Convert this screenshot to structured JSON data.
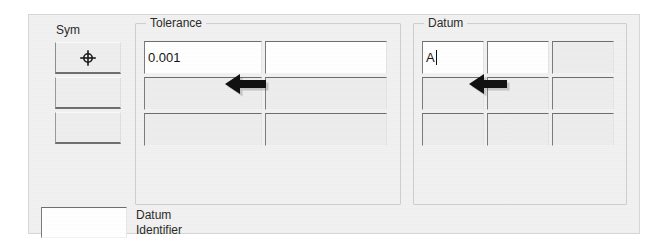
{
  "panel": {
    "sym": {
      "label": "Sym",
      "cells": [
        {
          "symbol": "position-symbol",
          "value": ""
        },
        {
          "symbol": "",
          "value": ""
        },
        {
          "symbol": "",
          "value": ""
        }
      ]
    },
    "tolerance": {
      "label": "Tolerance",
      "rows": [
        [
          {
            "value": "0.001",
            "enabled": true
          },
          {
            "value": "",
            "enabled": true
          }
        ],
        [
          {
            "value": "",
            "enabled": false
          },
          {
            "value": "",
            "enabled": false
          }
        ],
        [
          {
            "value": "",
            "enabled": false
          },
          {
            "value": "",
            "enabled": false
          }
        ]
      ]
    },
    "datum": {
      "label": "Datum",
      "rows": [
        [
          {
            "value": "A",
            "enabled": true,
            "caret": true
          },
          {
            "value": "",
            "enabled": true
          },
          {
            "value": "",
            "enabled": false
          }
        ],
        [
          {
            "value": "",
            "enabled": false
          },
          {
            "value": "",
            "enabled": false
          },
          {
            "value": "",
            "enabled": false
          }
        ],
        [
          {
            "value": "",
            "enabled": false
          },
          {
            "value": "",
            "enabled": false
          },
          {
            "value": "",
            "enabled": false
          }
        ]
      ]
    },
    "datum_identifier": {
      "label": "Datum\nIdentifier",
      "value": ""
    },
    "annotations": [
      {
        "name": "arrow-tolerance",
        "direction": "left"
      },
      {
        "name": "arrow-datum",
        "direction": "left"
      }
    ],
    "colors": {
      "panel_background": "#f1f1f1",
      "field_enabled": "#ffffff",
      "field_disabled": "#ededed",
      "text": "#151515",
      "annotation": "#111111"
    }
  }
}
